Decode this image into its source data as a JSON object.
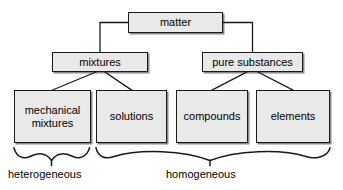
{
  "diagram": {
    "type": "hierarchy-tree",
    "colors": {
      "box_fill": "#e9e9e9",
      "box_stroke": "#1a1a1a",
      "line": "#1a1a1a",
      "text": "#000000",
      "background": "#ffffff"
    },
    "nodes": {
      "matter": {
        "label": "matter",
        "level": 0
      },
      "mixtures": {
        "label": "mixtures",
        "level": 1
      },
      "pure_substances": {
        "label": "pure substances",
        "level": 1
      },
      "mechanical_mixtures": {
        "label": "mechanical\nmixtures",
        "level": 2
      },
      "solutions": {
        "label": "solutions",
        "level": 2
      },
      "compounds": {
        "label": "compounds",
        "level": 2
      },
      "elements": {
        "label": "elements",
        "level": 2
      }
    },
    "edges": [
      {
        "from": "matter",
        "to": "mixtures",
        "style": "orthogonal"
      },
      {
        "from": "matter",
        "to": "pure_substances",
        "style": "orthogonal"
      },
      {
        "from": "mixtures",
        "to": "mechanical_mixtures",
        "style": "diagonal"
      },
      {
        "from": "mixtures",
        "to": "solutions",
        "style": "diagonal"
      },
      {
        "from": "pure_substances",
        "to": "compounds",
        "style": "diagonal"
      },
      {
        "from": "pure_substances",
        "to": "elements",
        "style": "diagonal"
      }
    ],
    "groups": [
      {
        "id": "heterogeneous",
        "label": "heterogeneous",
        "members": [
          "mechanical_mixtures"
        ]
      },
      {
        "id": "homogeneous",
        "label": "homogeneous",
        "members": [
          "solutions",
          "compounds",
          "elements"
        ]
      }
    ]
  }
}
